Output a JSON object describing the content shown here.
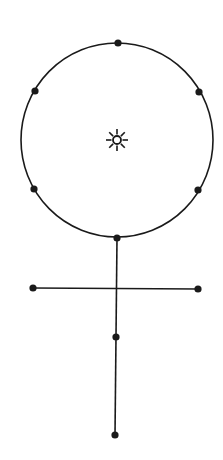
{
  "diagram": {
    "title": "",
    "background": "#ffffff",
    "stroke_color": "#1a1a1a",
    "circle": {
      "cx": 117,
      "cy": 140,
      "rx": 96,
      "ry": 97
    },
    "center_symbol": {
      "name": "sun-icon",
      "cx": 117,
      "cy": 140,
      "glyph": "☼"
    },
    "circle_points": [
      {
        "x": 118,
        "y": 43
      },
      {
        "x": 35,
        "y": 91
      },
      {
        "x": 199,
        "y": 92
      },
      {
        "x": 34,
        "y": 189
      },
      {
        "x": 198,
        "y": 190
      },
      {
        "x": 117,
        "y": 238
      }
    ],
    "stem": {
      "x1": 117,
      "y1": 238,
      "x2": 115,
      "y2": 435
    },
    "crossbar": {
      "x1": 33,
      "y1": 288,
      "x2": 198,
      "y2": 289
    },
    "stem_points": [
      {
        "x": 33,
        "y": 288
      },
      {
        "x": 198,
        "y": 289
      },
      {
        "x": 116,
        "y": 337
      },
      {
        "x": 115,
        "y": 435
      }
    ]
  }
}
